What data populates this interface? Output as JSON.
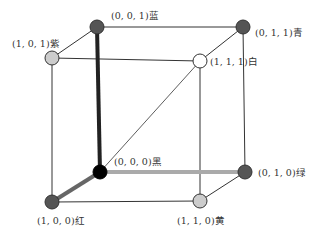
{
  "diagram": {
    "type": "rgb-color-cube",
    "vertices": [
      {
        "id": "v001",
        "coord": "(0, 0, 1)",
        "name": "蓝",
        "fill": "#555555",
        "x": 97,
        "y": 27,
        "label_x": 111,
        "label_y": 12
      },
      {
        "id": "v101",
        "coord": "(1, 0, 1)",
        "name": "紫",
        "fill": "#cccccc",
        "x": 52,
        "y": 58,
        "label_x": 12,
        "label_y": 40
      },
      {
        "id": "v011",
        "coord": "(0, 1, 1)",
        "name": "青",
        "fill": "#555555",
        "x": 243,
        "y": 27,
        "label_x": 255,
        "label_y": 29
      },
      {
        "id": "v111",
        "coord": "(1, 1, 1)",
        "name": "白",
        "fill": "#ffffff",
        "x": 200,
        "y": 61,
        "label_x": 210,
        "label_y": 58
      },
      {
        "id": "v000",
        "coord": "(0, 0, 0)",
        "name": "黑",
        "fill": "#000000",
        "x": 100,
        "y": 172,
        "label_x": 113,
        "label_y": 158
      },
      {
        "id": "v100",
        "coord": "(1, 0, 0)",
        "name": "红",
        "fill": "#555555",
        "x": 52,
        "y": 202,
        "label_x": 37,
        "label_y": 217
      },
      {
        "id": "v010",
        "coord": "(0, 1, 0)",
        "name": "绿",
        "fill": "#555555",
        "x": 245,
        "y": 172,
        "label_x": 258,
        "label_y": 169
      },
      {
        "id": "v110",
        "coord": "(1, 1, 0)",
        "name": "黄",
        "fill": "#cccccc",
        "x": 200,
        "y": 201,
        "label_x": 176,
        "label_y": 217
      }
    ],
    "axes": {
      "blue_axis_color": "#222222",
      "red_axis_color": "#666666",
      "green_axis_color": "#aaaaaa"
    }
  }
}
